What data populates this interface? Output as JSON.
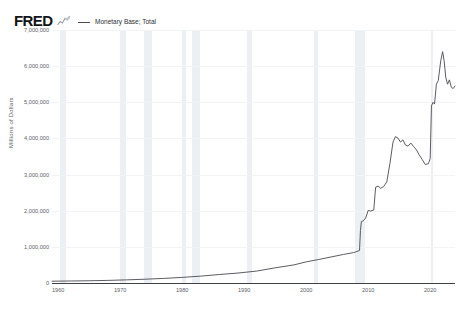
{
  "header": {
    "logo_text": "FRED",
    "logo_mark_icon": "mini-line-chart-icon",
    "legend": {
      "swatch_color": "#4a4a52",
      "label": "Monetary Base; Total"
    }
  },
  "chart_data": {
    "type": "line",
    "title": "",
    "xlabel": "",
    "ylabel": "Millions of Dollars",
    "xlim": [
      1959,
      2024
    ],
    "ylim": [
      0,
      7000000
    ],
    "grid": false,
    "legend_position": "top-left",
    "y_ticks": [
      "0",
      "1,000,000",
      "2,000,000",
      "3,000,000",
      "4,000,000",
      "5,000,000",
      "6,000,000",
      "7,000,000"
    ],
    "y_tick_values": [
      0,
      1000000,
      2000000,
      3000000,
      4000000,
      5000000,
      6000000,
      7000000
    ],
    "x_ticks": [
      "1960",
      "1970",
      "1980",
      "1990",
      "2000",
      "2010",
      "2020"
    ],
    "x_tick_values": [
      1960,
      1970,
      1980,
      1990,
      2000,
      2010,
      2020
    ],
    "series": [
      {
        "name": "Monetary Base; Total",
        "color": "#4a4a52",
        "x": [
          1959,
          1962,
          1965,
          1968,
          1971,
          1974,
          1977,
          1980,
          1983,
          1986,
          1989,
          1992,
          1995,
          1998,
          2000,
          2002,
          2004,
          2006,
          2007.6,
          2008.0,
          2008.6,
          2008.75,
          2008.9,
          2009.2,
          2009.6,
          2010.0,
          2010.4,
          2010.9,
          2011.2,
          2011.6,
          2012.0,
          2012.5,
          2013.0,
          2013.5,
          2014.0,
          2014.4,
          2014.8,
          2015.2,
          2015.6,
          2016.0,
          2016.4,
          2016.9,
          2017.3,
          2017.8,
          2018.2,
          2018.7,
          2019.2,
          2019.7,
          2020.0,
          2020.2,
          2020.45,
          2020.7,
          2021.0,
          2021.3,
          2021.7,
          2022.0,
          2022.25,
          2022.5,
          2022.8,
          2023.1,
          2023.4,
          2023.7,
          2024.0
        ],
        "y": [
          50000,
          55000,
          62000,
          72000,
          87000,
          105000,
          127000,
          155000,
          190000,
          235000,
          275000,
          330000,
          420000,
          500000,
          585000,
          650000,
          720000,
          790000,
          840000,
          860000,
          900000,
          1450000,
          1700000,
          1720000,
          1800000,
          2010000,
          1990000,
          2020000,
          2650000,
          2680000,
          2620000,
          2670000,
          2800000,
          3300000,
          3900000,
          4050000,
          4010000,
          3900000,
          3960000,
          3820000,
          3790000,
          3870000,
          3780000,
          3680000,
          3550000,
          3420000,
          3280000,
          3300000,
          3440000,
          4900000,
          5000000,
          4950000,
          5500000,
          5600000,
          6150000,
          6400000,
          6150000,
          5700000,
          5500000,
          5620000,
          5420000,
          5380000,
          5450000
        ]
      }
    ],
    "recession_bands": [
      {
        "start": 1960.3,
        "end": 1961.2
      },
      {
        "start": 1969.9,
        "end": 1970.9
      },
      {
        "start": 1973.9,
        "end": 1975.2
      },
      {
        "start": 1980.0,
        "end": 1980.6
      },
      {
        "start": 1981.5,
        "end": 1982.9
      },
      {
        "start": 1990.5,
        "end": 1991.2
      },
      {
        "start": 2001.2,
        "end": 2001.9
      },
      {
        "start": 2007.9,
        "end": 2009.5
      },
      {
        "start": 2020.1,
        "end": 2020.4
      }
    ],
    "recession_band_color": "#e9ecf1"
  }
}
